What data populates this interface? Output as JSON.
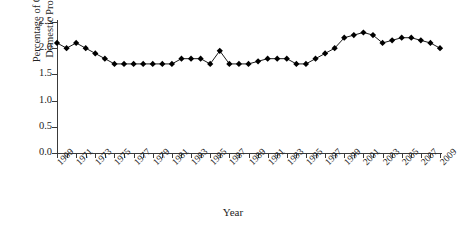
{
  "chart_data": {
    "type": "line",
    "title": "",
    "xlabel": "Year",
    "ylabel": "Percentage of Gross\nDomestic Product",
    "ylim": [
      0.0,
      2.5
    ],
    "xlim": [
      1969,
      2009
    ],
    "grid": false,
    "legend": null,
    "marker": "diamond",
    "y_ticks": [
      "0.0",
      "0.5",
      "1.0",
      "1.5",
      "2.0",
      "2.5"
    ],
    "y_tick_values": [
      0.0,
      0.5,
      1.0,
      1.5,
      2.0,
      2.5
    ],
    "x_tick_labels": [
      "1969",
      "1971",
      "1973",
      "1975",
      "1977",
      "1979",
      "1981",
      "1983",
      "1985",
      "1987",
      "1989",
      "1991",
      "1993",
      "1995",
      "1997",
      "1999",
      "2001",
      "2003",
      "2005",
      "2007",
      "2009"
    ],
    "x": [
      1969,
      1970,
      1971,
      1972,
      1973,
      1974,
      1975,
      1976,
      1977,
      1978,
      1979,
      1980,
      1981,
      1982,
      1983,
      1984,
      1985,
      1986,
      1987,
      1988,
      1989,
      1990,
      1991,
      1992,
      1993,
      1994,
      1995,
      1996,
      1997,
      1998,
      1999,
      2000,
      2001,
      2002,
      2003,
      2004,
      2005,
      2006,
      2007,
      2008,
      2009
    ],
    "values": [
      2.1,
      2.0,
      2.1,
      2.0,
      1.9,
      1.8,
      1.7,
      1.7,
      1.7,
      1.7,
      1.7,
      1.7,
      1.7,
      1.8,
      1.8,
      1.8,
      1.7,
      1.95,
      1.7,
      1.7,
      1.7,
      1.75,
      1.8,
      1.8,
      1.8,
      1.7,
      1.7,
      1.8,
      1.9,
      2.0,
      2.2,
      2.25,
      2.3,
      2.25,
      2.1,
      2.15,
      2.2,
      2.2,
      2.15,
      2.1,
      2.0
    ],
    "colors": {
      "series": "#000000",
      "axis": "#3a3a3a",
      "text": "#232323",
      "background": "#ffffff"
    }
  }
}
